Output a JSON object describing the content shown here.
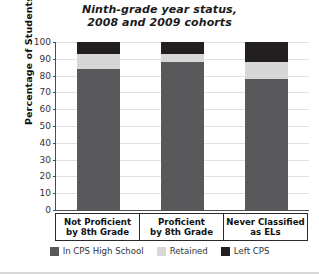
{
  "chart_data": {
    "type": "bar",
    "stacked": true,
    "title": "Ninth-grade year status, 2008 and 2009 cohorts",
    "title_lines": [
      "Ninth-grade year status,",
      "2008 and 2009 cohorts"
    ],
    "xlabel": "",
    "ylabel": "Percentage of Students",
    "ylim": [
      0,
      100
    ],
    "ytick_labels": [
      "0",
      "10",
      "20",
      "30",
      "40",
      "50",
      "60",
      "70",
      "80",
      "90",
      "100"
    ],
    "ytick_values": [
      0,
      10,
      20,
      30,
      40,
      50,
      60,
      70,
      80,
      90,
      100
    ],
    "grid": true,
    "legend_position": "bottom",
    "categories": [
      "Not Proficient by 8th Grade",
      "Proficient by 8th Grade",
      "Never Classified as ELs"
    ],
    "category_lines": [
      [
        "Not Proficient",
        "by 8th Grade"
      ],
      [
        "Proficient",
        "by 8th Grade"
      ],
      [
        "Never Classified",
        "as ELs"
      ]
    ],
    "series": [
      {
        "name": "In CPS High School",
        "color": "#59595b",
        "values": [
          84,
          88,
          78
        ]
      },
      {
        "name": "Retained",
        "color": "#d7d7d7",
        "values": [
          9,
          5,
          10
        ]
      },
      {
        "name": "Left CPS",
        "color": "#231f20",
        "values": [
          7,
          7,
          12
        ]
      }
    ]
  },
  "legend": {
    "items": [
      {
        "label": "In CPS High School",
        "color": "#59595b"
      },
      {
        "label": "Retained",
        "color": "#d7d7d7"
      },
      {
        "label": "Left CPS",
        "color": "#231f20"
      }
    ]
  },
  "axes": {
    "y_title": "Percentage of Students"
  }
}
